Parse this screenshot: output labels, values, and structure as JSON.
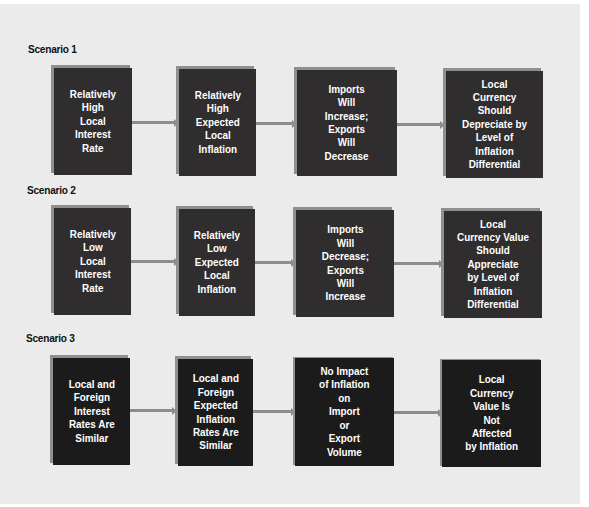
{
  "diagram": {
    "colors": {
      "panel_background": "#ebebeb",
      "box_fill": "#2f2d2e",
      "box_fill_scenario3": "#1c1b1c",
      "box_shadow": "#8f8f8f",
      "arrow": "#8c8c8c",
      "box_text": "#ffffff"
    },
    "scenarios": [
      {
        "label": "Scenario 1",
        "steps": [
          {
            "text": "Relatively\nHigh\nLocal\nInterest\nRate"
          },
          {
            "text": "Relatively\nHigh\nExpected\nLocal\nInflation"
          },
          {
            "text": "Imports\nWill\nIncrease;\nExports\nWill\nDecrease"
          },
          {
            "text": "Local\nCurrency\nShould\nDepreciate by\nLevel of\nInflation Differential"
          }
        ]
      },
      {
        "label": "Scenario 2",
        "steps": [
          {
            "text": "Relatively\nLow\nLocal\nInterest\nRate"
          },
          {
            "text": "Relatively\nLow\nExpected\nLocal\nInflation"
          },
          {
            "text": "Imports\nWill\nDecrease;\nExports\nWill\nIncrease"
          },
          {
            "text": "Local\nCurrency Value\nShould\nAppreciate\nby Level of\nInflation Differential"
          }
        ]
      },
      {
        "label": "Scenario 3",
        "steps": [
          {
            "text": "Local and\nForeign\nInterest\nRates Are\nSimilar"
          },
          {
            "text": "Local and\nForeign\nExpected\nInflation\nRates Are\nSimilar"
          },
          {
            "text": "No Impact\nof Inflation\non\nImport\nor\nExport\nVolume"
          },
          {
            "text": "Local\nCurrency\nValue Is\nNot\nAffected\nby Inflation"
          }
        ]
      }
    ]
  }
}
